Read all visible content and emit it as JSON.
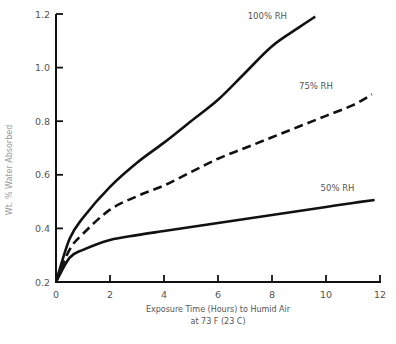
{
  "chart_data": {
    "type": "line",
    "title": "",
    "xlabel": "Exposure Time (Hours) to Humid Air",
    "xlabel_line2": "at 73 F (23 C)",
    "ylabel": "Wt. % Water Absorbed",
    "xlim": [
      0,
      12
    ],
    "ylim": [
      0.2,
      1.2
    ],
    "x_ticks": [
      0,
      2,
      4,
      6,
      8,
      10,
      12
    ],
    "y_ticks": [
      0.2,
      0.4,
      0.6,
      0.8,
      1.0,
      1.2
    ],
    "x_tick_labels": [
      "0",
      "2",
      "4",
      "6",
      "8",
      "10",
      "12"
    ],
    "y_tick_labels": [
      "0.2",
      "0.4",
      "0.6",
      "0.8",
      "1.0",
      "1.2"
    ],
    "grid": false,
    "legend": "inline labels at curve ends",
    "series": [
      {
        "name": "100% RH",
        "style": "solid",
        "x": [
          0,
          0.5,
          1,
          2,
          3,
          4,
          5,
          6,
          7,
          8,
          9,
          9.6
        ],
        "values": [
          0.2,
          0.36,
          0.44,
          0.555,
          0.645,
          0.72,
          0.8,
          0.88,
          0.98,
          1.08,
          1.15,
          1.19
        ]
      },
      {
        "name": "75% RH",
        "style": "dashed",
        "x": [
          0,
          0.5,
          1,
          2,
          3,
          4,
          5,
          6,
          7,
          8,
          9,
          10,
          11,
          11.7
        ],
        "values": [
          0.2,
          0.32,
          0.38,
          0.47,
          0.52,
          0.56,
          0.61,
          0.66,
          0.7,
          0.74,
          0.78,
          0.82,
          0.86,
          0.9
        ]
      },
      {
        "name": "50% RH",
        "style": "solid",
        "x": [
          0,
          0.5,
          1,
          2,
          3,
          4,
          5,
          6,
          7,
          8,
          9,
          10,
          11,
          11.8
        ],
        "values": [
          0.2,
          0.29,
          0.32,
          0.357,
          0.375,
          0.39,
          0.405,
          0.42,
          0.435,
          0.45,
          0.465,
          0.48,
          0.495,
          0.506
        ]
      }
    ],
    "series_label_positions": [
      {
        "name": "100% RH",
        "x": 7.1,
        "y": 1.18
      },
      {
        "name": "75% RH",
        "x": 9.0,
        "y": 0.92
      },
      {
        "name": "50% RH",
        "x": 9.8,
        "y": 0.54
      }
    ]
  }
}
